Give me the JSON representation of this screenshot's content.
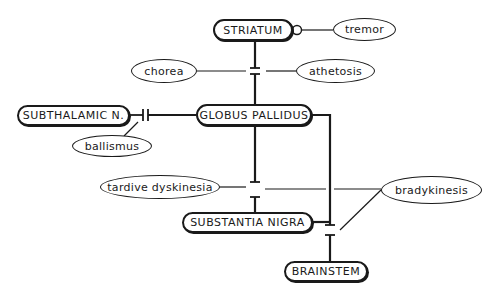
{
  "diagram": {
    "nodes": {
      "striatum": "STRIATUM",
      "globus_pallidus": "GLOBUS PALLIDUS",
      "subthalamic": "SUBTHALAMIC N.",
      "substantia_nigra": "SUBSTANTIA NIGRA",
      "brainstem": "BRAINSTEM"
    },
    "disorders": {
      "tremor": "tremor",
      "chorea": "chorea",
      "athetosis": "athetosis",
      "ballismus": "ballismus",
      "tardive_dyskinesia": "tardive dyskinesia",
      "bradykinesis": "bradykinesis"
    },
    "edges": [
      {
        "from": "STRIATUM",
        "to": "GLOBUS PALLIDUS",
        "lesion_labels": [
          "chorea",
          "athetosis"
        ]
      },
      {
        "from": "SUBTHALAMIC N.",
        "to": "GLOBUS PALLIDUS",
        "lesion_labels": [
          "ballismus"
        ]
      },
      {
        "from": "GLOBUS PALLIDUS",
        "to": "SUBSTANTIA NIGRA",
        "lesion_labels": [
          "tardive dyskinesia",
          "bradykinesis"
        ]
      },
      {
        "from": "GLOBUS PALLIDUS",
        "to": "BRAINSTEM",
        "lesion_labels": [
          "bradykinesis"
        ]
      },
      {
        "from": "SUBSTANTIA NIGRA",
        "to": "BRAINSTEM",
        "lesion_labels": [
          "bradykinesis"
        ]
      },
      {
        "from": "STRIATUM",
        "to": "tremor",
        "lesion_labels": []
      }
    ]
  }
}
